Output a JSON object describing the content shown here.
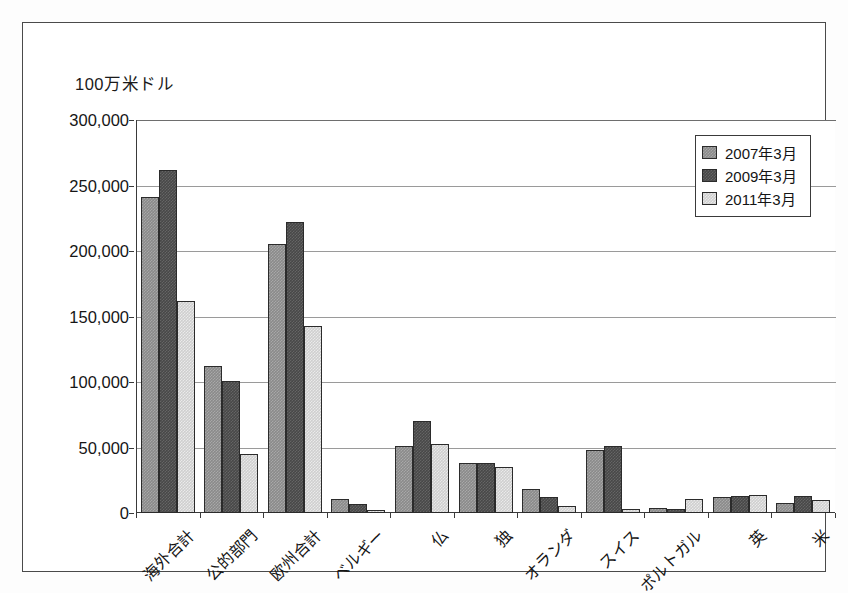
{
  "figure": {
    "unit_caption": "100万米ドル"
  },
  "chart_data": {
    "type": "bar",
    "title": "",
    "subtitle": "",
    "xlabel": "",
    "ylabel": "100万米ドル",
    "ylim": [
      0,
      300000
    ],
    "ytick_values": [
      0,
      50000,
      100000,
      150000,
      200000,
      250000,
      300000
    ],
    "ytick_labels": [
      "0",
      "50,000",
      "100,000",
      "150,000",
      "200,000",
      "250,000",
      "300,000"
    ],
    "grid": true,
    "legend_position": "upper-right",
    "categories": [
      "海外合計",
      "公的部門",
      "欧州合計",
      "ベルギー",
      "仏",
      "独",
      "オランダ",
      "スイス",
      "ポルトガル",
      "英",
      "米"
    ],
    "series": [
      {
        "name": "2007年3月",
        "color": "#8a8a8a",
        "values": [
          241000,
          112000,
          205000,
          11000,
          51000,
          38000,
          18000,
          48000,
          4000,
          12000,
          8000
        ]
      },
      {
        "name": "2009年3月",
        "color": "#484848",
        "values": [
          262000,
          101000,
          222000,
          7000,
          70000,
          38000,
          12000,
          51000,
          3000,
          13000,
          13000
        ]
      },
      {
        "name": "2011年3月",
        "color": "#cfcfcf",
        "values": [
          162000,
          45000,
          143000,
          2000,
          53000,
          35000,
          5000,
          3000,
          11000,
          14000,
          10000
        ]
      }
    ]
  }
}
